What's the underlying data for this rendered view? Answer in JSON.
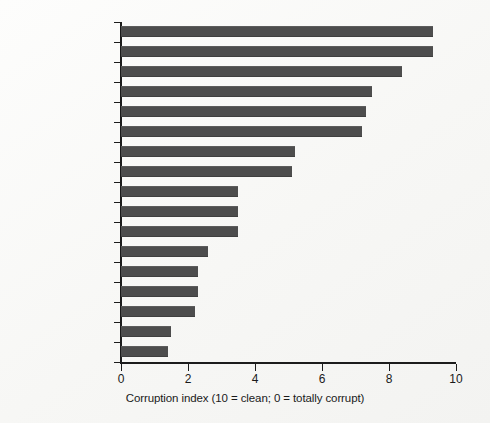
{
  "chart_data": {
    "type": "bar",
    "orientation": "horizontal",
    "title": "",
    "xlabel": "Corruption index (10 = clean; 0 = totally corrupt)",
    "ylabel": "",
    "xlim": [
      0,
      10
    ],
    "grid": false,
    "legend": null,
    "xticks": [
      "0",
      "2",
      "4",
      "6",
      "8",
      "10"
    ],
    "xtick_values": [
      0,
      2,
      4,
      6,
      8,
      10
    ],
    "categories": [
      "Finland",
      "New Zealand",
      "United Kingdom",
      "Japan",
      "France",
      "United States",
      "Italy",
      "South Korea",
      "Brazil",
      "China",
      "India",
      "Vietnam",
      "Russia",
      "Indonesia",
      "Nigeria",
      "Iraq",
      "Somalia"
    ],
    "values": [
      9.3,
      9.3,
      8.4,
      7.5,
      7.3,
      7.2,
      5.2,
      5.1,
      3.5,
      3.5,
      3.5,
      2.6,
      2.3,
      2.3,
      2.2,
      1.5,
      1.4
    ],
    "bar_color": "#4d4d4d"
  }
}
